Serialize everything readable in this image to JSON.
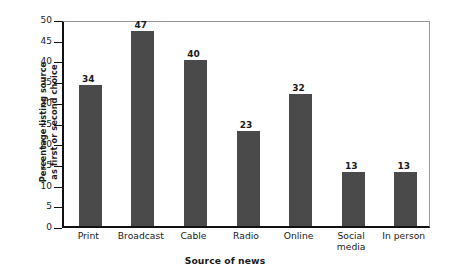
{
  "chart_data": {
    "type": "bar",
    "title": "",
    "xlabel": "Source of news",
    "ylabel": "Percentage listing source as first or second choice",
    "ylabel_line1": "Percentage listing source",
    "ylabel_line2": "as first or second choice",
    "categories": [
      "Print",
      "Broadcast",
      "Cable",
      "Radio",
      "Online",
      "Social media",
      "In person"
    ],
    "values": [
      34,
      47,
      40,
      23,
      32,
      13,
      13
    ],
    "ylim": [
      0,
      50
    ],
    "ytick_labels": [
      "50",
      "45",
      "40",
      "35",
      "30",
      "25",
      "20",
      "15",
      "10",
      "5",
      "0"
    ],
    "ytick_values": [
      50,
      45,
      40,
      35,
      30,
      25,
      20,
      15,
      10,
      5,
      0
    ],
    "grid": false,
    "legend": null,
    "bar_color": "#4a4a4a",
    "axis_color": "#111111",
    "frame_color": "#9a9a9a",
    "background": "#ffffff"
  }
}
